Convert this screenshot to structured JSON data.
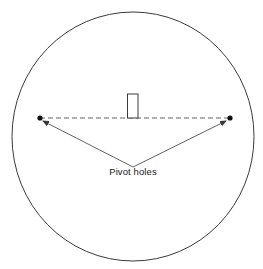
{
  "diagram": {
    "type": "pivot-hole layout",
    "label": "Pivot holes",
    "colors": {
      "stroke": "#3a3a3a",
      "dot": "#111111",
      "text": "#1a1a1a",
      "background": "#ffffff"
    },
    "circle": {
      "cx": 133,
      "cy": 136.5,
      "rx": 121,
      "ry": 124.5
    },
    "holes": [
      {
        "name": "left-pivot-hole",
        "x": 40,
        "y": 118
      },
      {
        "name": "right-pivot-hole",
        "x": 230,
        "y": 118
      }
    ],
    "marker": {
      "x": 127.5,
      "y": 94,
      "width": 10.5,
      "height": 24
    },
    "arrow_origin": {
      "x": 133,
      "y": 167
    }
  }
}
